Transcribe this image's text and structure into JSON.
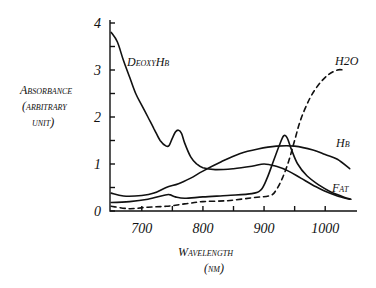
{
  "chart_data": {
    "type": "line",
    "title": "",
    "xlabel": "Wavelength (nm)",
    "ylabel": "Absorbance (arbitrary unit)",
    "xlim": [
      648,
      1052
    ],
    "ylim": [
      0,
      4
    ],
    "x_ticks": [
      700,
      800,
      900,
      1000
    ],
    "x_minor_ticks": [
      750,
      850,
      950
    ],
    "y_ticks": [
      0,
      1,
      2,
      3,
      4
    ],
    "y_minor_ticks": [
      0.5,
      1.5,
      2.5,
      3.5
    ],
    "grid": false,
    "legend": "inline labels",
    "series": [
      {
        "name": "DeoxyHb",
        "style": "solid",
        "points": [
          [
            650,
            3.8
          ],
          [
            660,
            3.6
          ],
          [
            670,
            3.2
          ],
          [
            680,
            2.85
          ],
          [
            690,
            2.5
          ],
          [
            700,
            2.25
          ],
          [
            710,
            2.0
          ],
          [
            720,
            1.75
          ],
          [
            730,
            1.5
          ],
          [
            740,
            1.38
          ],
          [
            745,
            1.4
          ],
          [
            750,
            1.55
          ],
          [
            755,
            1.68
          ],
          [
            760,
            1.72
          ],
          [
            765,
            1.65
          ],
          [
            770,
            1.45
          ],
          [
            780,
            1.15
          ],
          [
            790,
            1.0
          ],
          [
            800,
            0.92
          ],
          [
            820,
            0.88
          ],
          [
            850,
            0.9
          ],
          [
            880,
            0.95
          ],
          [
            900,
            1.0
          ],
          [
            920,
            0.95
          ],
          [
            940,
            0.85
          ],
          [
            960,
            0.7
          ],
          [
            980,
            0.55
          ],
          [
            1000,
            0.42
          ],
          [
            1020,
            0.32
          ],
          [
            1040,
            0.25
          ]
        ]
      },
      {
        "name": "Hb",
        "style": "solid",
        "points": [
          [
            650,
            0.38
          ],
          [
            670,
            0.32
          ],
          [
            700,
            0.33
          ],
          [
            720,
            0.38
          ],
          [
            740,
            0.5
          ],
          [
            760,
            0.58
          ],
          [
            780,
            0.7
          ],
          [
            800,
            0.85
          ],
          [
            830,
            1.05
          ],
          [
            860,
            1.22
          ],
          [
            890,
            1.32
          ],
          [
            920,
            1.38
          ],
          [
            950,
            1.38
          ],
          [
            980,
            1.3
          ],
          [
            1000,
            1.2
          ],
          [
            1020,
            1.1
          ],
          [
            1040,
            0.9
          ]
        ]
      },
      {
        "name": "Fat",
        "style": "solid",
        "points": [
          [
            650,
            0.18
          ],
          [
            680,
            0.2
          ],
          [
            710,
            0.25
          ],
          [
            735,
            0.33
          ],
          [
            745,
            0.35
          ],
          [
            755,
            0.3
          ],
          [
            770,
            0.27
          ],
          [
            800,
            0.3
          ],
          [
            840,
            0.33
          ],
          [
            880,
            0.37
          ],
          [
            895,
            0.45
          ],
          [
            905,
            0.7
          ],
          [
            915,
            1.05
          ],
          [
            925,
            1.4
          ],
          [
            932,
            1.6
          ],
          [
            938,
            1.55
          ],
          [
            945,
            1.3
          ],
          [
            955,
            1.0
          ],
          [
            970,
            0.75
          ],
          [
            990,
            0.55
          ],
          [
            1010,
            0.4
          ],
          [
            1030,
            0.3
          ],
          [
            1042,
            0.25
          ]
        ]
      },
      {
        "name": "H2O",
        "style": "dashed",
        "points": [
          [
            650,
            0.1
          ],
          [
            680,
            0.05
          ],
          [
            710,
            0.08
          ],
          [
            740,
            0.1
          ],
          [
            770,
            0.15
          ],
          [
            800,
            0.2
          ],
          [
            840,
            0.22
          ],
          [
            880,
            0.28
          ],
          [
            910,
            0.33
          ],
          [
            920,
            0.45
          ],
          [
            930,
            0.7
          ],
          [
            940,
            1.05
          ],
          [
            950,
            1.5
          ],
          [
            960,
            1.95
          ],
          [
            975,
            2.4
          ],
          [
            990,
            2.7
          ],
          [
            1005,
            2.9
          ],
          [
            1020,
            3.0
          ],
          [
            1030,
            3.0
          ]
        ]
      }
    ],
    "annotations": [
      {
        "text": "DeoxyHb",
        "x": 150,
        "y": 61
      },
      {
        "text": "H2O",
        "x": 335,
        "y": 63
      },
      {
        "text": "Hb",
        "x": 336,
        "y": 145
      },
      {
        "text": "Fat",
        "x": 336,
        "y": 191
      }
    ]
  },
  "labels": {
    "ylabel_line1": "Absorbance",
    "ylabel_line2": "(arbitrary",
    "ylabel_line3": "unit)",
    "xlabel_line1": "Wavelength",
    "xlabel_line2": "(nm)",
    "deoxyhb": "DeoxyHb",
    "h2o": "H2O",
    "hb": "Hb",
    "fat": "Fat"
  }
}
